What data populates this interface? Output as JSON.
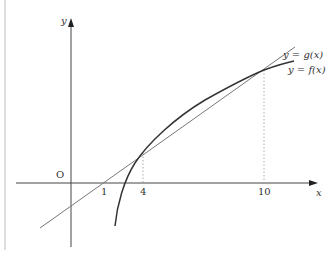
{
  "diagram": {
    "type": "function-graph",
    "axes": {
      "x_label": "x",
      "y_label": "y",
      "origin_label": "O"
    },
    "x_ticks": [
      "1",
      "4",
      "10"
    ],
    "curves": [
      {
        "name": "g",
        "label": "y = g(x)",
        "kind": "line",
        "color": "#777777"
      },
      {
        "name": "f",
        "label": "y = f(x)",
        "kind": "curve",
        "color": "#333333"
      }
    ],
    "intersections": [
      {
        "x": "4",
        "guide": "dotted"
      },
      {
        "x": "10",
        "guide": "dotted"
      }
    ],
    "g_x_intercept": "1"
  }
}
